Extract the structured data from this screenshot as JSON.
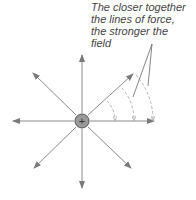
{
  "caption": {
    "lines": [
      "The closer together",
      "the lines of force,",
      "the stronger the",
      "field"
    ]
  },
  "charge": {
    "symbol": "+",
    "center": [
      82,
      121
    ]
  },
  "colors": {
    "line": "#8a8a8a",
    "dashed": "#aaaaaa",
    "charge_fill": "#999999",
    "text": "#444444"
  }
}
